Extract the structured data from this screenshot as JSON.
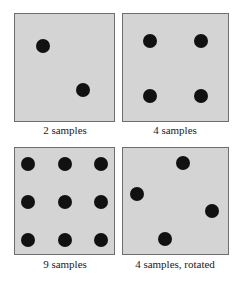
{
  "panels": [
    {
      "caption": "2 samples",
      "box": {
        "x": 14,
        "y": 13,
        "w": 101,
        "h": 109
      },
      "samples": [
        [
          43,
          46
        ],
        [
          83,
          90
        ]
      ]
    },
    {
      "caption": "4 samples",
      "box": {
        "x": 122,
        "y": 13,
        "w": 107,
        "h": 109
      },
      "samples": [
        [
          150,
          41
        ],
        [
          201,
          41
        ],
        [
          150,
          96
        ],
        [
          201,
          96
        ]
      ]
    },
    {
      "caption": "9 samples",
      "box": {
        "x": 14,
        "y": 147,
        "w": 101,
        "h": 108
      },
      "samples": [
        [
          28,
          164
        ],
        [
          65,
          164
        ],
        [
          101,
          164
        ],
        [
          28,
          202
        ],
        [
          65,
          202
        ],
        [
          101,
          202
        ],
        [
          28,
          240
        ],
        [
          65,
          240
        ],
        [
          101,
          240
        ]
      ]
    },
    {
      "caption": "4 samples, rotated",
      "box": {
        "x": 122,
        "y": 147,
        "w": 107,
        "h": 108
      },
      "samples": [
        [
          183,
          163
        ],
        [
          137,
          194
        ],
        [
          212,
          211
        ],
        [
          165,
          239
        ]
      ]
    }
  ],
  "colors": {
    "panel_bg": "#d4d4d4",
    "dot": "#111111",
    "border": "#6e6e6e"
  }
}
